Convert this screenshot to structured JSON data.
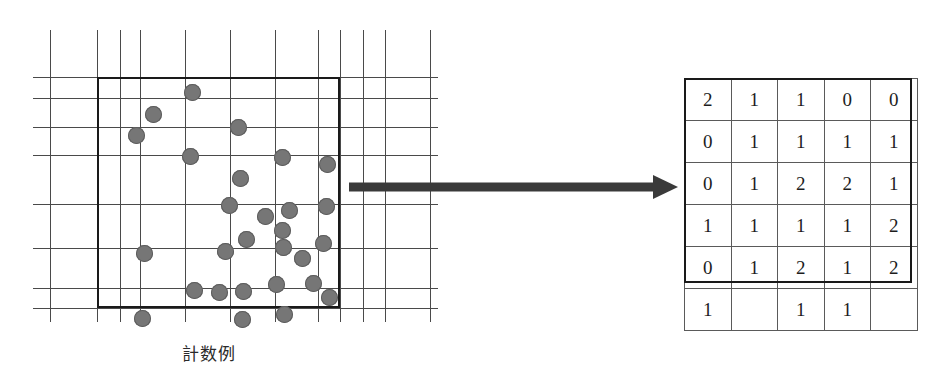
{
  "figure": {
    "left_panel": {
      "caption": "計数例",
      "grid": {
        "vertical_lines_x": [
          17,
          64,
          87,
          107,
          152,
          197,
          242,
          285,
          307,
          330,
          352,
          397
        ],
        "horizontal_lines_y": [
          47,
          68,
          97,
          125,
          174,
          218,
          258,
          278
        ],
        "width": 405,
        "height": 292,
        "line_color": "#4a4a4a"
      },
      "roi_rectangle": {
        "x": 64,
        "y": 47,
        "width": 243,
        "height": 231,
        "border_color": "#1a1a1a",
        "border_width": 2.5
      },
      "dot_color": "#767676",
      "dot_diameter": 17,
      "dots": [
        [
          159,
          62
        ],
        [
          120,
          84
        ],
        [
          103,
          105
        ],
        [
          205,
          97
        ],
        [
          157,
          126
        ],
        [
          249,
          127
        ],
        [
          207,
          148
        ],
        [
          294,
          134
        ],
        [
          256,
          180
        ],
        [
          293,
          176
        ],
        [
          196,
          175
        ],
        [
          232,
          186
        ],
        [
          249,
          200
        ],
        [
          111,
          223
        ],
        [
          192,
          221
        ],
        [
          213,
          209
        ],
        [
          250,
          217
        ],
        [
          269,
          228
        ],
        [
          290,
          213
        ],
        [
          161,
          260
        ],
        [
          186,
          262
        ],
        [
          210,
          261
        ],
        [
          243,
          254
        ],
        [
          280,
          253
        ],
        [
          296,
          267
        ],
        [
          109,
          288
        ],
        [
          209,
          289
        ],
        [
          251,
          284
        ]
      ]
    },
    "arrow": {
      "from_x": 348,
      "to_x": 676,
      "y": 187,
      "color": "#3a3a3a",
      "name": "transform-arrow"
    },
    "right_panel": {
      "caption": "計算例",
      "table": {
        "rows": [
          [
            "2",
            "1",
            "1",
            "0",
            "0"
          ],
          [
            "0",
            "1",
            "1",
            "1",
            "1"
          ],
          [
            "0",
            "1",
            "2",
            "2",
            "1"
          ],
          [
            "1",
            "1",
            "1",
            "1",
            "2"
          ],
          [
            "0",
            "1",
            "2",
            "1",
            "2"
          ],
          [
            "1",
            "",
            "1",
            "1",
            ""
          ]
        ],
        "highlighted_rows": 5,
        "columns": 5,
        "total_rows": 6,
        "cell_border_color": "#5a5a5a",
        "outline_color": "#1a1a1a"
      }
    }
  }
}
